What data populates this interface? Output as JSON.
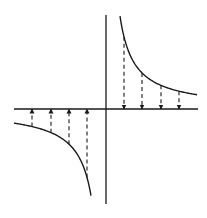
{
  "diagram": {
    "type": "hyperbola-with-vertical-arrows",
    "colors": {
      "background": "#ffffff",
      "stroke": "#1a1a1a"
    },
    "origin": {
      "x": 106,
      "y": 109
    },
    "k": 1300,
    "axes": {
      "horizontal": {
        "x1": 14,
        "x2": 198,
        "y": 109
      },
      "vertical": {
        "x": 106,
        "y1": 15,
        "y2": 204
      }
    },
    "branches": [
      {
        "name": "upper-right",
        "x_start": 120,
        "x_end": 197
      },
      {
        "name": "lower-left",
        "x_start": 14,
        "x_end": 91
      }
    ],
    "arrows": [
      {
        "branch": "upper-right",
        "x": 124,
        "direction": "down"
      },
      {
        "branch": "upper-right",
        "x": 142,
        "direction": "down"
      },
      {
        "branch": "upper-right",
        "x": 161,
        "direction": "down"
      },
      {
        "branch": "upper-right",
        "x": 179,
        "direction": "down"
      },
      {
        "branch": "lower-left",
        "x": 32,
        "direction": "up"
      },
      {
        "branch": "lower-left",
        "x": 51,
        "direction": "up"
      },
      {
        "branch": "lower-left",
        "x": 69,
        "direction": "up"
      },
      {
        "branch": "lower-left",
        "x": 87,
        "direction": "up"
      }
    ]
  }
}
